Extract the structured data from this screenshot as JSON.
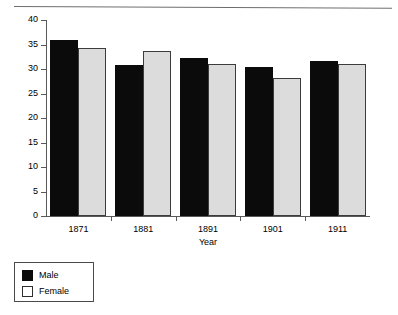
{
  "chart_data": {
    "type": "bar",
    "title": "",
    "xlabel": "Year",
    "ylabel": "Per cent of all admissions",
    "categories": [
      "1871",
      "1881",
      "1891",
      "1901",
      "1911"
    ],
    "series": [
      {
        "name": "Male",
        "color": "#0b0b0b",
        "values": [
          35.9,
          30.8,
          32.2,
          30.4,
          31.7
        ]
      },
      {
        "name": "Female",
        "color": "#dcdcdc",
        "values": [
          34.3,
          33.7,
          31.0,
          28.2,
          31.1
        ]
      }
    ],
    "ylim": [
      0,
      40
    ],
    "yticks": [
      0,
      5,
      10,
      15,
      20,
      25,
      30,
      35,
      40
    ],
    "ytick_labels": [
      "0",
      "5",
      "10",
      "15",
      "20",
      "25",
      "30",
      "35",
      "40"
    ],
    "grid": false,
    "legend_position": "bottom-left",
    "legend_entries": [
      "Male",
      "Female"
    ]
  },
  "legend": {
    "male_label": "Male",
    "female_label": "Female"
  },
  "axes": {
    "y_title": "Per cent of all admissions",
    "x_title": "Year"
  }
}
